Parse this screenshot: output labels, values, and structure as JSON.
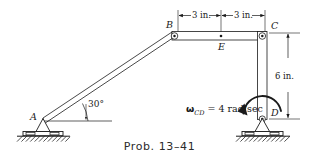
{
  "figure": {
    "caption": "Prob. 13–41",
    "points": {
      "a": "A",
      "b": "B",
      "c": "C",
      "d": "D",
      "e": "E"
    },
    "dimensions": {
      "top_left": "3 in.",
      "top_right": "3 in.",
      "right_vertical": "6 in."
    },
    "angle": {
      "value": "30°"
    },
    "omega": {
      "symbol": "ω",
      "subscript": "CD",
      "equals": "=",
      "value": "4 rad/sec",
      "full_text": "ωCD = 4 rad/sec"
    },
    "colors": {
      "line": "#1a1a1a",
      "fill": "#ffffff",
      "background": "#ffffff",
      "caption": "#2b2b2b",
      "hatch": "#1a1a1a"
    }
  }
}
